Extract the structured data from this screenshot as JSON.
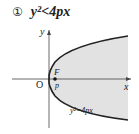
{
  "title": {
    "number": "①",
    "inequality": "y²<4px"
  },
  "diagram": {
    "axis_x_label": "x",
    "axis_y_label": "y",
    "origin_label": "O",
    "focus_label": "F",
    "focus_distance_label": "p",
    "curve_label": "y²=4px",
    "region_fill": "#e2e2e2",
    "curve_color": "#222222",
    "axis_color": "#444444"
  }
}
